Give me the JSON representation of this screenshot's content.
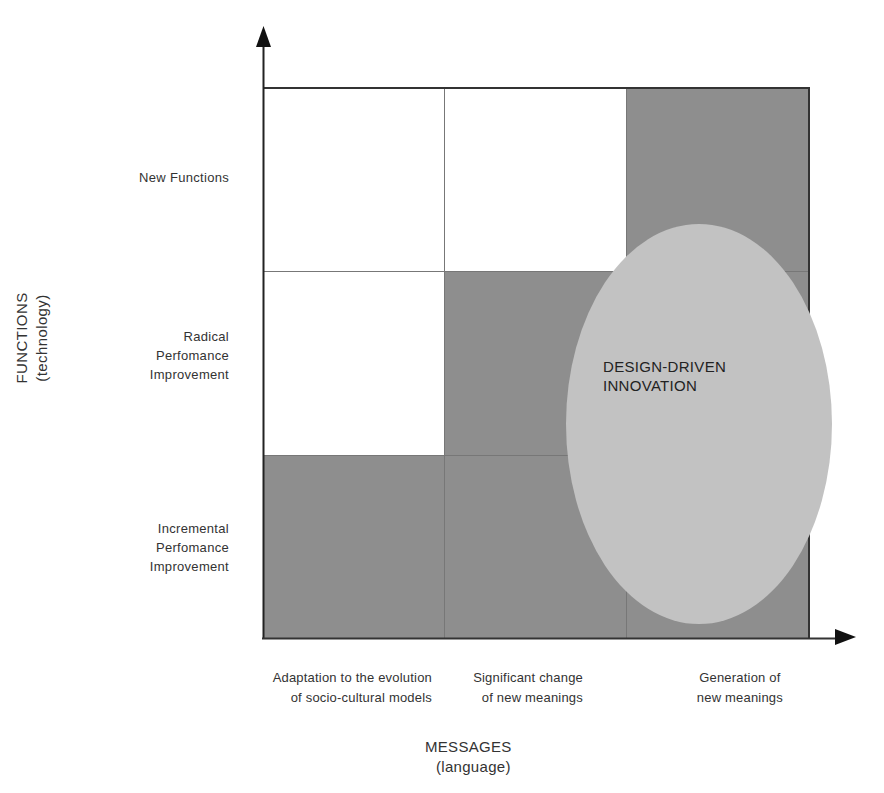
{
  "diagram": {
    "type": "2x2+ matrix (3x3 grid)",
    "colors": {
      "background": "#ffffff",
      "highlighted_cell": "#8e8e8e",
      "empty_cell": "#ffffff",
      "ellipse": "#c2c2c2",
      "axis": "#222222",
      "grid_line": "#777777"
    },
    "y_axis": {
      "title": "FUNCTIONS",
      "subtitle": "(technology)",
      "levels": [
        {
          "lines": [
            "New Functions"
          ]
        },
        {
          "lines": [
            "Radical",
            "Perfomance",
            "Improvement"
          ]
        },
        {
          "lines": [
            "Incremental",
            "Perfomance",
            "Improvement"
          ]
        }
      ]
    },
    "x_axis": {
      "title": "MESSAGES",
      "subtitle": "(language)",
      "levels": [
        {
          "lines": [
            "Adaptation to the evolution",
            "of socio-cultural models"
          ]
        },
        {
          "lines": [
            "Significant change",
            "of new meanings"
          ]
        },
        {
          "lines": [
            "Generation of",
            "new meanings"
          ]
        }
      ]
    },
    "grid": {
      "rows": [
        "New Functions",
        "Radical Perfomance Improvement",
        "Incremental Perfomance Improvement"
      ],
      "cols": [
        "Adaptation",
        "Significant change",
        "Generation"
      ],
      "cells": [
        [
          "white",
          "white",
          "gray"
        ],
        [
          "white",
          "gray",
          "gray"
        ],
        [
          "gray",
          "gray",
          "gray"
        ]
      ]
    },
    "ellipse": {
      "label_line1": "DESIGN-DRIVEN",
      "label_line2": "INNOVATION"
    }
  }
}
